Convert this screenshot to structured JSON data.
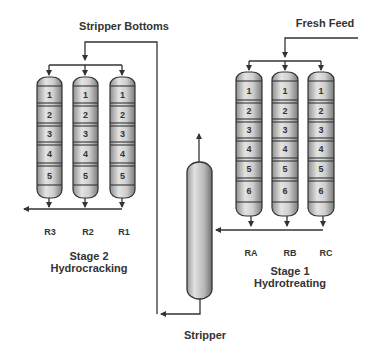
{
  "diagram": {
    "colors": {
      "line": "#333333",
      "vessel_light": "#e6e6e6",
      "vessel_dark": "#8a8a8a",
      "text": "#333333"
    },
    "streams": {
      "stripper_bottoms": "Stripper Bottoms",
      "fresh_feed": "Fresh Feed"
    },
    "stage2": {
      "title": "Stage 2",
      "subtitle": "Hydrocracking",
      "reactors": [
        {
          "label": "R3",
          "beds": [
            "1",
            "2",
            "3",
            "4",
            "5"
          ]
        },
        {
          "label": "R2",
          "beds": [
            "1",
            "2",
            "3",
            "4",
            "5"
          ]
        },
        {
          "label": "R1",
          "beds": [
            "1",
            "2",
            "3",
            "4",
            "5"
          ]
        }
      ]
    },
    "stage1": {
      "title": "Stage 1",
      "subtitle": "Hydrotreating",
      "reactors": [
        {
          "label": "RA",
          "beds": [
            "1",
            "2",
            "3",
            "4",
            "5",
            "6"
          ]
        },
        {
          "label": "RB",
          "beds": [
            "1",
            "2",
            "3",
            "4",
            "5",
            "6"
          ]
        },
        {
          "label": "RC",
          "beds": [
            "1",
            "2",
            "3",
            "4",
            "5",
            "6"
          ]
        }
      ]
    },
    "stripper": {
      "label": "Stripper"
    }
  }
}
